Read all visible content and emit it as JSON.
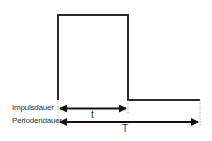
{
  "diagram": {
    "type": "pulse-waveform",
    "labels": {
      "pulse_duration": "Impulsdauer",
      "period_duration": "Periodendauer",
      "pulse_symbol": "t",
      "period_symbol": "T"
    },
    "colors": {
      "line": "#2b2b2b",
      "guide": "#999999"
    }
  }
}
